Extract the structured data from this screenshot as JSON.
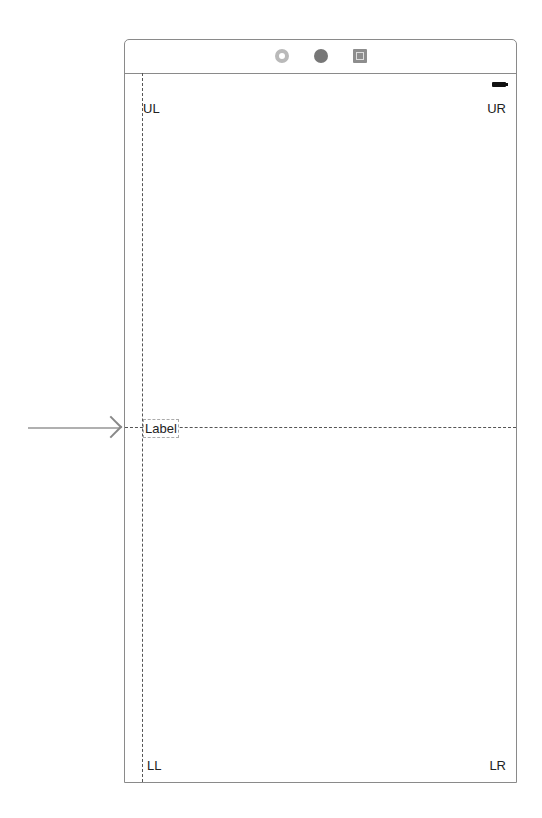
{
  "scene_dock": {
    "icons": [
      "view-controller-icon",
      "first-responder-icon",
      "exit-icon"
    ]
  },
  "status_bar": {
    "battery": "battery-icon"
  },
  "labels": {
    "upper_left": "UL",
    "upper_right": "UR",
    "lower_left": "LL",
    "lower_right": "LR",
    "center": "Label"
  },
  "entry_point": {
    "icon": "storyboard-entry-arrow"
  }
}
